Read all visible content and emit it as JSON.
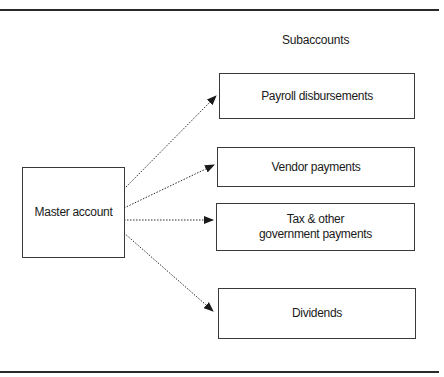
{
  "diagram": {
    "heading": "Subaccounts",
    "master": {
      "label": "Master account"
    },
    "subaccounts": [
      {
        "label": "Payroll disbursements"
      },
      {
        "label": "Vendor payments"
      },
      {
        "label_line1": "Tax & other",
        "label_line2": "government payments"
      },
      {
        "label": "Dividends"
      }
    ],
    "connector_style": "dotted-arrow",
    "colors": {
      "line": "#2a2a2a",
      "box_border": "#3a3a3a",
      "background": "#ffffff",
      "text": "#1a1a1a"
    }
  }
}
